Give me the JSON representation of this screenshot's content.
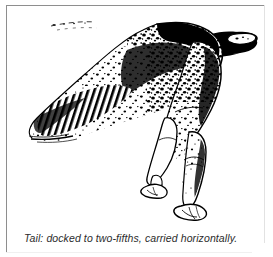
{
  "figure": {
    "caption": "Tail: docked to two-fifths, carried horizontally.",
    "alt_description": "Pen-and-ink illustration of the hindquarters of a short-haired pointer showing a docked tail carried horizontally",
    "frame_color": "#8e8e8e",
    "background_color": "#ffffff",
    "ink_color": "#000000",
    "parts": {
      "tail": "docked-tail",
      "croup": "croup",
      "thigh": "upper-thigh",
      "stifle": "stifle",
      "hock": "hock",
      "rear_left_leg": "rear-left-leg",
      "rear_right_leg": "rear-right-leg",
      "left_paw": "left-paw",
      "right_paw": "right-paw",
      "coat_pattern": "ticked-speckled-coat"
    }
  }
}
